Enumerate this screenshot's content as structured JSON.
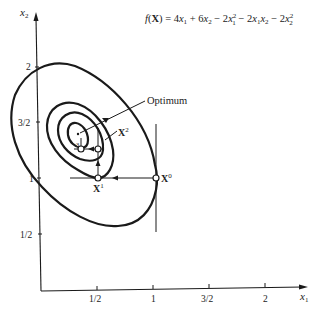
{
  "diagram": {
    "title_formula": {
      "lhs": "f(X) = ",
      "terms": [
        "4x",
        "1",
        " + 6x",
        "2",
        " − 2x",
        "1",
        "2",
        " − 2x",
        "1",
        "x",
        "2",
        " − 2x",
        "2",
        "2"
      ],
      "text": "f(X) = 4x1 + 6x2 − 2x1^2 − 2x1x2 − 2x2^2"
    },
    "axes": {
      "x_label": "x",
      "x_label_sub": "1",
      "y_label": "x",
      "y_label_sub": "2",
      "x_ticks": [
        "1/2",
        "1",
        "3/2",
        "2"
      ],
      "y_ticks": [
        "2",
        "3/2",
        "1",
        "1/2"
      ]
    },
    "points": {
      "x0": {
        "label": "X",
        "sup": "0",
        "coords": [
          1,
          1
        ]
      },
      "x1": {
        "label": "X",
        "sup": "1",
        "coords": [
          0.5,
          1
        ]
      },
      "x2": {
        "label": "X",
        "sup": "2",
        "coords": [
          0.5,
          1.25
        ]
      }
    },
    "annotations": {
      "optimum": "Optimum",
      "step_label": "3"
    },
    "colors": {
      "ink": "#1a1a1a",
      "background": "#ffffff"
    }
  }
}
